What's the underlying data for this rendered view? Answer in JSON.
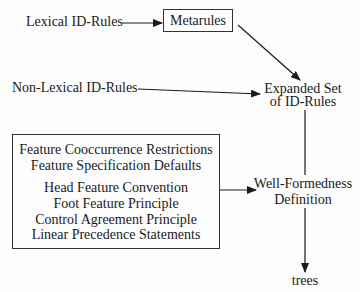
{
  "diagram": {
    "nodes": {
      "lexical_id_rules": "Lexical ID-Rules",
      "metarules": "Metarules",
      "non_lexical_id_rules": "Non-Lexical ID-Rules",
      "expanded_set": {
        "line1": "Expanded Set",
        "line2": "of ID-Rules"
      },
      "constraints_box": {
        "group1": [
          "Feature Cooccurrence Restrictions",
          "Feature Specification Defaults"
        ],
        "group2": [
          "Head Feature Convention",
          "Foot Feature Principle",
          "Control Agreement Principle",
          "Linear Precedence Statements"
        ]
      },
      "well_formedness": {
        "line1": "Well-Formedness",
        "line2": "Definition"
      },
      "trees": "trees"
    },
    "edges": [
      {
        "from": "Lexical ID-Rules",
        "to": "Metarules"
      },
      {
        "from": "Metarules",
        "to": "Expanded Set of ID-Rules"
      },
      {
        "from": "Non-Lexical ID-Rules",
        "to": "Expanded Set of ID-Rules"
      },
      {
        "from": "Expanded Set of ID-Rules",
        "to": "Well-Formedness Definition"
      },
      {
        "from": "Constraints box",
        "to": "Well-Formedness Definition"
      },
      {
        "from": "Well-Formedness Definition",
        "to": "trees"
      }
    ],
    "colors": {
      "ink": "#1a1a1a",
      "background": "#fdfdfd"
    }
  }
}
